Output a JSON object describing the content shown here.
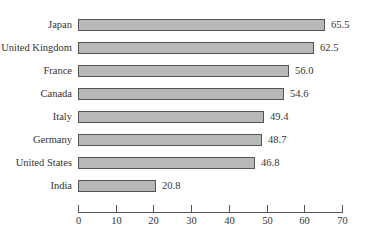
{
  "chart_data": {
    "type": "bar",
    "orientation": "horizontal",
    "title": "",
    "xlabel": "",
    "ylabel": "",
    "categories": [
      "Japan",
      "United Kingdom",
      "France",
      "Canada",
      "Italy",
      "Germany",
      "United States",
      "India"
    ],
    "values": [
      65.5,
      62.5,
      56.0,
      54.6,
      49.4,
      48.7,
      46.8,
      20.8
    ],
    "value_labels": [
      "65.5",
      "62.5",
      "56.0",
      "54.6",
      "49.4",
      "48.7",
      "46.8",
      "20.8"
    ],
    "xlim": [
      0,
      70
    ],
    "xticks": [
      "0",
      "10",
      "20",
      "30",
      "40",
      "50",
      "60",
      "70"
    ],
    "grid": false,
    "legend": null,
    "bar_color": "#b8b8b8",
    "bar_edge_color": "#555555"
  }
}
